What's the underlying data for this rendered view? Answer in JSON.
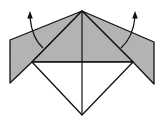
{
  "diagram": {
    "type": "origami-fold-step",
    "colors": {
      "paper_colored": "#b3b3b3",
      "paper_white": "#ffffff",
      "line": "#111111"
    },
    "arrows": [
      {
        "name": "left-fold-arrow",
        "direction": "up"
      },
      {
        "name": "right-fold-arrow",
        "direction": "up"
      }
    ]
  }
}
